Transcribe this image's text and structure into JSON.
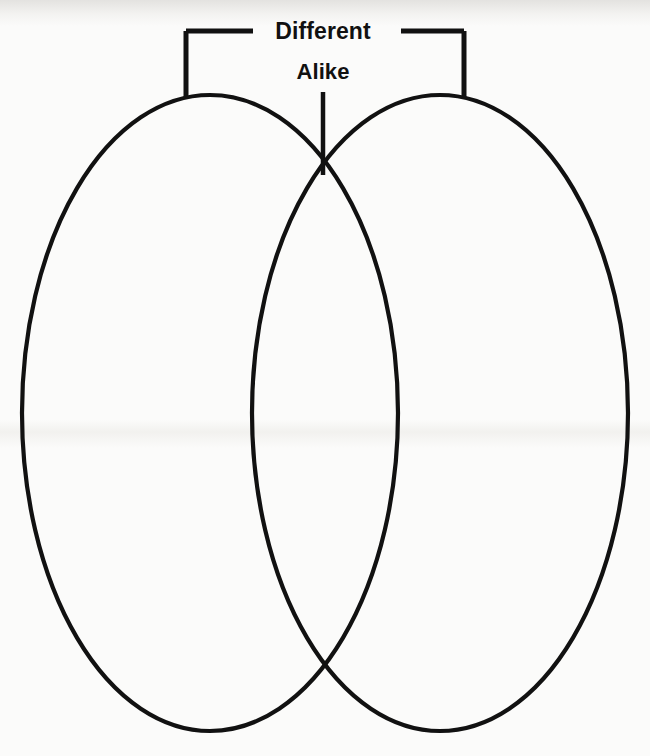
{
  "page": {
    "background_color": "#fbfbfa",
    "ink_color": "#111111"
  },
  "diagram": {
    "type": "venn-diagram",
    "shape": "two-overlapping-ellipses",
    "labels": {
      "different": "Different",
      "alike": "Alike"
    },
    "annotations": {
      "different_bracket": "bracket spanning the two non-overlapping outer regions",
      "alike_pointer": "vertical line pointing to the overlap region"
    },
    "regions": [
      {
        "name": "left-circle",
        "label": "",
        "meaning": "Different"
      },
      {
        "name": "overlap",
        "label": "",
        "meaning": "Alike"
      },
      {
        "name": "right-circle",
        "label": "",
        "meaning": "Different"
      }
    ],
    "geometry": {
      "left_ellipse": {
        "cx": 210,
        "cy": 413,
        "rx": 188,
        "ry": 318
      },
      "right_ellipse": {
        "cx": 440,
        "cy": 413,
        "rx": 188,
        "ry": 318
      },
      "upper_intersection": {
        "x": 323,
        "y": 150
      },
      "lower_intersection": {
        "x": 323,
        "y": 672
      },
      "stroke_width": 4.2
    },
    "bracket": {
      "left_vertical_x": 186,
      "right_vertical_x": 464,
      "horizontal_y": 31,
      "left_horizontal_end_x": 253,
      "right_horizontal_start_x": 401,
      "vertical_bottom_y": 98,
      "stroke_width": 5
    },
    "pointer": {
      "x": 323,
      "top_y": 92,
      "bottom_y": 175,
      "stroke_width": 4.5
    }
  }
}
